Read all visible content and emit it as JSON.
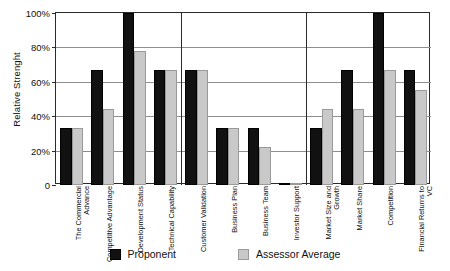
{
  "chart_data": {
    "type": "bar",
    "title": "",
    "xlabel": "",
    "ylabel": "Relative Strenght",
    "ylim": [
      0,
      100
    ],
    "yunit": "%",
    "grid": true,
    "legend_position": "bottom",
    "ytick_labels": [
      "100%",
      "80%",
      "60%",
      "40%",
      "20%",
      "0"
    ],
    "ytick_values": [
      100,
      80,
      60,
      40,
      20,
      0
    ],
    "categories": [
      "The Commercial Advance",
      "Competitive Advantage",
      "Development Status",
      "Technical Capability",
      "Customer Validation",
      "Business Plan",
      "Business Team",
      "Investor Support",
      "Market Size and Growth",
      "Market Share",
      "Competition",
      "Financial Returns to VC"
    ],
    "group_breaks_after": [
      3,
      7
    ],
    "series": [
      {
        "name": "Proponent",
        "color": "#111111",
        "values": [
          33,
          67,
          100,
          67,
          67,
          33,
          33,
          1,
          33,
          67,
          100,
          67
        ]
      },
      {
        "name": "Assessor Average",
        "color": "#c9c9c9",
        "values": [
          33,
          44,
          78,
          67,
          67,
          33,
          22,
          1,
          44,
          44,
          67,
          55
        ]
      }
    ]
  },
  "legend": {
    "items": [
      {
        "label": "Proponent",
        "swatch": "black-square-icon"
      },
      {
        "label": "Assessor Average",
        "swatch": "gray-square-icon"
      }
    ]
  }
}
